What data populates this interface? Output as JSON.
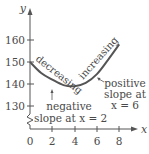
{
  "chart_data": {
    "type": "line",
    "title": "",
    "xlabel": "x",
    "ylabel": "y",
    "xlim": [
      0,
      8
    ],
    "ylim": [
      130,
      160
    ],
    "y_axis_break": true,
    "grid": false,
    "x_ticks": [
      "0",
      "2",
      "4",
      "6",
      "8"
    ],
    "y_ticks": [
      "130",
      "140",
      "150",
      "160"
    ],
    "series": [
      {
        "name": "f(x)",
        "x": [
          0,
          1,
          2,
          3,
          4,
          5,
          6,
          7,
          8
        ],
        "values": [
          150,
          145,
          142,
          139.5,
          139,
          140.5,
          144.5,
          151,
          158
        ]
      }
    ],
    "curve_labels": {
      "left": "decreasing",
      "right": "increasing"
    },
    "annotations": [
      {
        "text_line1": "negative",
        "text_line2": "slope at x = 2",
        "x": 2
      },
      {
        "text_line1": "positive",
        "text_line2": "slope at",
        "text_line3": "x = 6",
        "x": 6
      }
    ],
    "colors": {
      "curve": "#555555",
      "axis": "#555555",
      "text": "#4a4a4a"
    }
  }
}
